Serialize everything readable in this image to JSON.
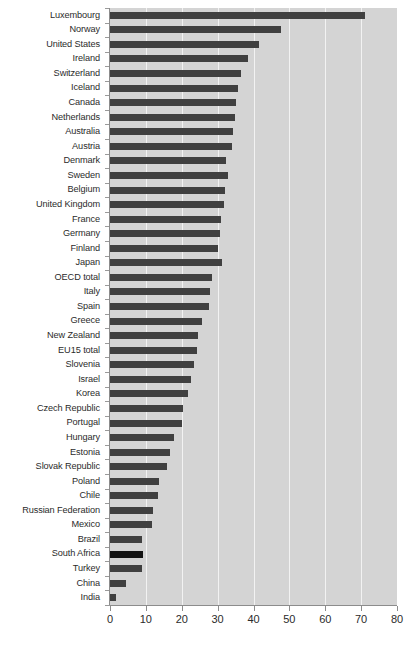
{
  "chart_data": {
    "type": "bar",
    "orientation": "horizontal",
    "title": "",
    "subtitle": "",
    "xlabel": "",
    "ylabel": "",
    "xlim": [
      0,
      80
    ],
    "xticks": [
      0,
      10,
      20,
      30,
      40,
      50,
      60,
      70,
      80
    ],
    "xtick_labels": [
      "0",
      "10",
      "20",
      "30",
      "40",
      "50",
      "60",
      "70",
      "80"
    ],
    "grid": true,
    "grid_axis": "x",
    "legend": false,
    "legend_position": "none",
    "bar_color": "#404040",
    "highlight_color": "#141414",
    "highlight_categories": [
      "South Africa"
    ],
    "plot_background": "#d4d4d4",
    "gridline_color": "#f2f2f2",
    "categories": [
      "Luxembourg",
      "Norway",
      "United States",
      "Ireland",
      "Switzerland",
      "Iceland",
      "Canada",
      "Netherlands",
      "Australia",
      "Austria",
      "Denmark",
      "Sweden",
      "Belgium",
      "United Kingdom",
      "France",
      "Germany",
      "Finland",
      "Japan",
      "OECD total",
      "Italy",
      "Spain",
      "Greece",
      "New Zealand",
      "EU15 total",
      "Slovenia",
      "Israel",
      "Korea",
      "Czech Republic",
      "Portugal",
      "Hungary",
      "Estonia",
      "Slovak Republic",
      "Poland",
      "Chile",
      "Russian Federation",
      "Mexico",
      "Brazil",
      "South Africa",
      "Turkey",
      "China",
      "India"
    ],
    "values": [
      71.0,
      47.6,
      41.5,
      38.4,
      36.5,
      35.7,
      35.1,
      34.8,
      34.3,
      34.0,
      32.3,
      32.9,
      32.0,
      31.7,
      30.9,
      30.6,
      30.2,
      31.2,
      28.4,
      27.9,
      27.6,
      25.6,
      24.5,
      24.2,
      23.4,
      22.6,
      21.7,
      20.3,
      20.1,
      17.8,
      16.7,
      15.9,
      13.6,
      13.4,
      12.0,
      11.7,
      8.9,
      9.2,
      8.9,
      4.5,
      1.7
    ]
  }
}
